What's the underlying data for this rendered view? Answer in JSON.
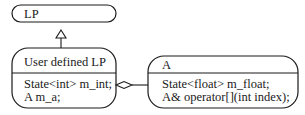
{
  "diagram": {
    "type": "class-diagram",
    "nodes": [
      {
        "id": "lp",
        "title": "LP",
        "members": []
      },
      {
        "id": "user-lp",
        "title": "User defined LP",
        "members": [
          "State<int> m_int;",
          "A m_a;"
        ]
      },
      {
        "id": "a",
        "title": "A",
        "members": [
          "State<float> m_float;",
          "A& operator[](int index);"
        ]
      }
    ],
    "edges": [
      {
        "from": "user-lp",
        "to": "lp",
        "kind": "inheritance"
      },
      {
        "from": "user-lp",
        "to": "a",
        "kind": "aggregation"
      }
    ]
  }
}
